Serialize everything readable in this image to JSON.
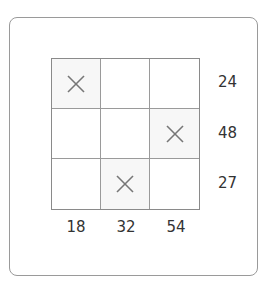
{
  "puzzle": {
    "rows": 3,
    "cols": 3,
    "row_clues": [
      "24",
      "48",
      "27"
    ],
    "col_clues": [
      "18",
      "32",
      "54"
    ],
    "cells": [
      [
        "x",
        "",
        ""
      ],
      [
        "",
        "",
        "x"
      ],
      [
        "",
        "x",
        ""
      ]
    ]
  }
}
